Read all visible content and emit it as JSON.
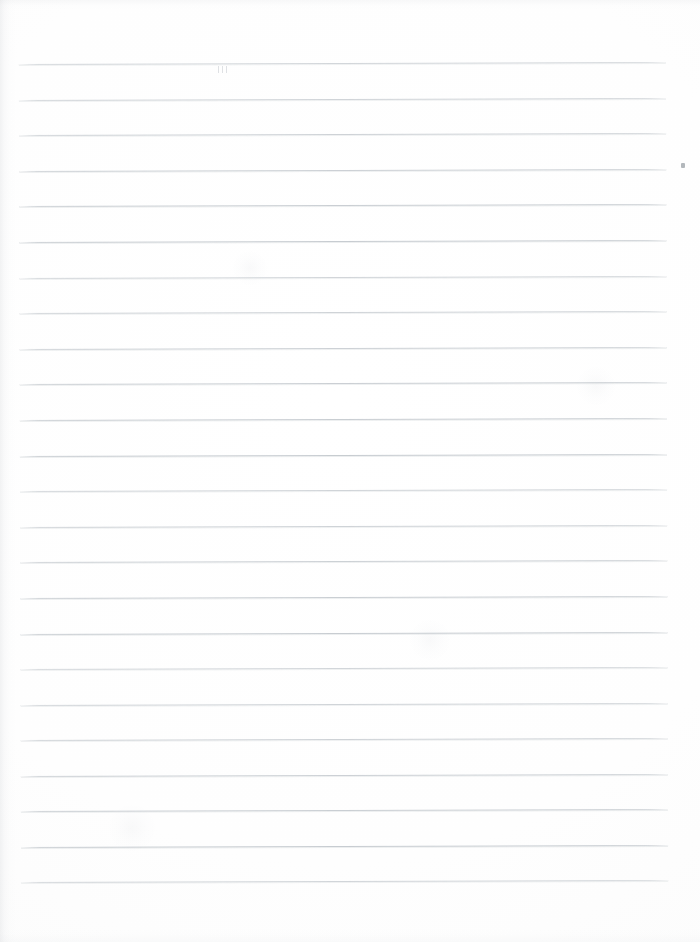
{
  "page": {
    "kind": "scanned-lined-paper",
    "width": 700,
    "height": 942,
    "background_color": "#fdfdfd",
    "content_text": "",
    "has_handwriting": false,
    "has_printed_text": false
  },
  "rules": {
    "count": 24,
    "color": "#c6cbd0",
    "thickness_px": 1,
    "first_line_y": 63,
    "last_line_y": 881,
    "spacing_px": 35.6,
    "left_x": 20,
    "right_x": 667,
    "skew_degrees": -0.16,
    "positions_y": [
      63,
      99,
      134,
      170,
      205,
      241,
      277,
      312,
      348,
      383,
      419,
      455,
      490,
      526,
      561,
      597,
      633,
      668,
      704,
      739,
      775,
      810,
      846,
      881
    ]
  },
  "margins": {
    "left_px": 20,
    "right_px": 33,
    "top_px": 63,
    "bottom_px": 61
  },
  "artifacts": {
    "speck": {
      "x": 681,
      "y": 163,
      "color": "#9aa0a6"
    },
    "tick_marks": {
      "x": 218,
      "y": 66,
      "count": 3
    },
    "edge_shadow_side": "left"
  },
  "smudges": [
    {
      "x": 250,
      "y": 268,
      "size": 34
    },
    {
      "x": 430,
      "y": 640,
      "size": 40
    },
    {
      "x": 132,
      "y": 828,
      "size": 46
    },
    {
      "x": 596,
      "y": 386,
      "size": 38
    }
  ]
}
